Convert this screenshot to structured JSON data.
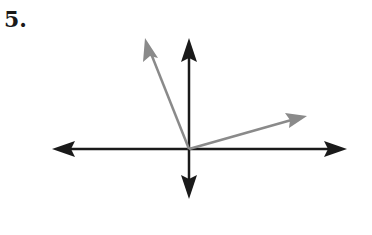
{
  "problem": {
    "number": "5."
  },
  "diagram": {
    "colors": {
      "axes": "#1a1a1a",
      "vectors": "#8a8a8a"
    },
    "origin": [
      189,
      149
    ],
    "axes": {
      "x_left_tip": [
        52,
        149
      ],
      "x_right_tip": [
        347,
        149
      ],
      "y_top_tip": [
        189,
        38
      ],
      "y_bottom_tip": [
        189,
        199
      ]
    },
    "vectors": [
      {
        "name": "vector-upper-left",
        "tip": [
          145,
          38
        ]
      },
      {
        "name": "vector-right",
        "tip": [
          307,
          116
        ]
      }
    ]
  }
}
